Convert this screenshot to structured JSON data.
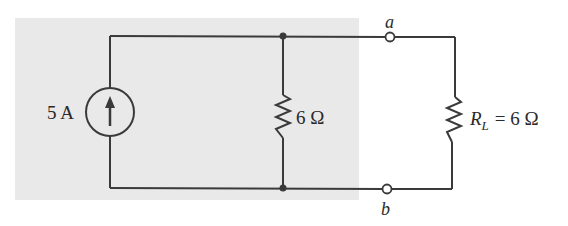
{
  "diagram": {
    "type": "circuit-schematic",
    "background": "#ffffff",
    "shaded_region_color": "#e9e9e9",
    "wire_color": "#3a3a3a",
    "components": {
      "current_source": {
        "label": "5 A",
        "value": "5",
        "unit": "A",
        "direction": "up"
      },
      "shunt_resistor": {
        "label": "6 Ω",
        "value": "6",
        "unit": "Ω"
      },
      "load_resistor": {
        "symbol": "R",
        "subscript": "L",
        "equals": "= 6 Ω",
        "value": "6",
        "unit": "Ω"
      }
    },
    "terminals": {
      "a": "a",
      "b": "b"
    }
  }
}
